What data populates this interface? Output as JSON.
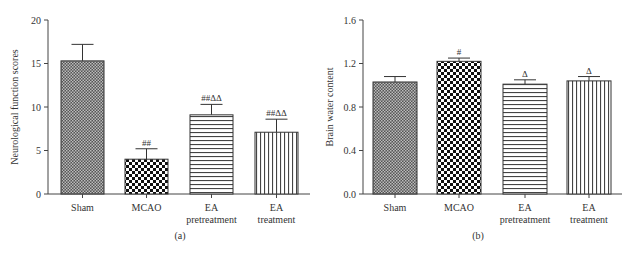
{
  "chart_data": [
    {
      "type": "bar",
      "panel_label": "(a)",
      "title": "",
      "xlabel": "",
      "ylabel": "Neurological function scores",
      "ylim": [
        0,
        20
      ],
      "yticks": [
        "0",
        "5",
        "10",
        "15",
        "20"
      ],
      "categories": [
        "Sham",
        "MCAO",
        "EA pretreatment",
        "EA treatment"
      ],
      "category_lines": [
        [
          "Sham"
        ],
        [
          "MCAO"
        ],
        [
          "EA",
          "pretreatment"
        ],
        [
          "EA",
          "treatment"
        ]
      ],
      "values": [
        15.3,
        4.0,
        9.1,
        7.1
      ],
      "errors": [
        1.9,
        1.2,
        1.2,
        1.5
      ],
      "annotations": [
        "",
        "##",
        "##ΔΔ",
        "##ΔΔ"
      ],
      "patterns": [
        "fine-checker",
        "coarse-checker",
        "horizontal-lines",
        "vertical-lines"
      ],
      "grid": false,
      "legend": "none"
    },
    {
      "type": "bar",
      "panel_label": "(b)",
      "title": "",
      "xlabel": "",
      "ylabel": "Brain water content",
      "ylim": [
        0,
        1.6
      ],
      "yticks": [
        "0.0",
        "0.4",
        "0.8",
        "1.2",
        "1.6"
      ],
      "categories": [
        "Sham",
        "MCAO",
        "EA pretreatment",
        "EA treatment"
      ],
      "category_lines": [
        [
          "Sham"
        ],
        [
          "MCAO"
        ],
        [
          "EA",
          "pretreatment"
        ],
        [
          "EA",
          "treatment"
        ]
      ],
      "values": [
        1.03,
        1.22,
        1.01,
        1.04
      ],
      "errors": [
        0.05,
        0.03,
        0.04,
        0.04
      ],
      "annotations": [
        "",
        "#",
        "Δ",
        "Δ"
      ],
      "patterns": [
        "fine-checker",
        "coarse-checker",
        "horizontal-lines",
        "vertical-lines"
      ],
      "grid": false,
      "legend": "none"
    }
  ]
}
